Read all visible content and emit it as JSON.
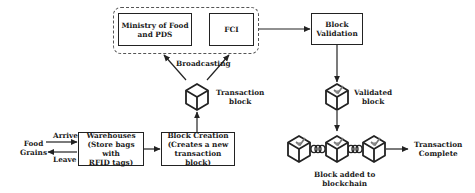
{
  "diagram": {
    "group": {
      "nodes": [
        {
          "id": "ministry",
          "lines": [
            "Ministry of Food",
            "and PDS"
          ]
        },
        {
          "id": "fci",
          "lines": [
            "FCI"
          ]
        }
      ]
    },
    "block_validation": {
      "lines": [
        "Block",
        "Validation"
      ]
    },
    "warehouses": {
      "lines": [
        "Warehouses",
        "(Store bags with",
        "RFID tags)"
      ]
    },
    "block_creation": {
      "lines": [
        "Block Creation",
        "(Creates a new",
        "transaction block)"
      ]
    },
    "labels": {
      "broadcasting": "Broadcasting",
      "transaction_block": [
        "Transaction",
        "block"
      ],
      "validated_block": [
        "Validated",
        "block"
      ],
      "food_grains": [
        "Food",
        "Grains"
      ],
      "arrive": "Arrive",
      "leave": "Leave",
      "block_added": [
        "Block added to",
        "blockchain"
      ],
      "transaction_complete": [
        "Transaction",
        "Complete"
      ]
    },
    "edges": [
      {
        "from": "food_grains",
        "to": "warehouses",
        "label": "Arrive"
      },
      {
        "from": "warehouses",
        "to": "food_grains",
        "label": "Leave"
      },
      {
        "from": "warehouses",
        "to": "block_creation"
      },
      {
        "from": "block_creation",
        "to": "transaction_block"
      },
      {
        "from": "transaction_block",
        "to": "ministry",
        "label": "Broadcasting"
      },
      {
        "from": "transaction_block",
        "to": "fci",
        "label": "Broadcasting"
      },
      {
        "from": "group",
        "to": "block_validation"
      },
      {
        "from": "block_validation",
        "to": "validated_block"
      },
      {
        "from": "validated_block",
        "to": "blockchain"
      },
      {
        "from": "blockchain",
        "to": "transaction_complete"
      }
    ],
    "colors": {
      "stroke": "#222222",
      "dash": "#555555",
      "background": "#ffffff"
    }
  }
}
